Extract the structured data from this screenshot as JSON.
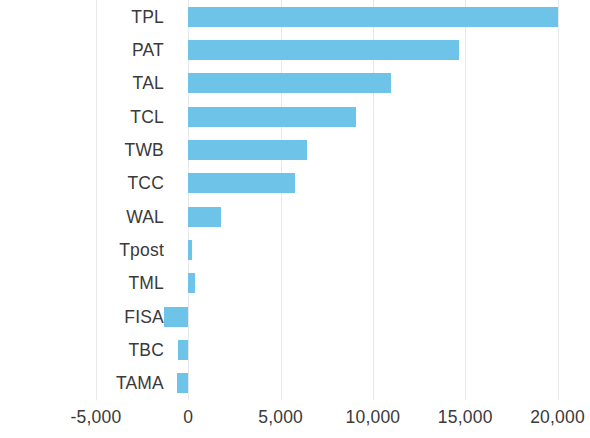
{
  "chart": {
    "type": "bar",
    "orientation": "horizontal",
    "title": "",
    "xlabel": "",
    "ylabel": "",
    "bar_color": "#6ec3e9",
    "gridline_color": "#e6e9ec",
    "text_color": "#3a3a3a",
    "background_color": "#ffffff"
  },
  "chart_data": {
    "type": "bar",
    "orientation": "horizontal",
    "title": "",
    "subtitle": "",
    "xlabel": "",
    "ylabel": "",
    "categories": [
      "TPL",
      "PAT",
      "TAL",
      "TCL",
      "TWB",
      "TCC",
      "WAL",
      "Tpost",
      "TML",
      "FISA",
      "TBC",
      "TAMA"
    ],
    "values": [
      20000,
      14650,
      11000,
      9070,
      6450,
      5790,
      1750,
      200,
      350,
      -1310,
      -550,
      -600
    ],
    "series": [
      {
        "name": "",
        "values": [
          20000,
          14650,
          11000,
          9070,
          6450,
          5790,
          1750,
          200,
          350,
          -1310,
          -550,
          -600
        ]
      }
    ],
    "xlim": [
      -5000,
      21000
    ],
    "xticks": [
      -5000,
      0,
      5000,
      10000,
      15000,
      20000
    ],
    "xticklabels": [
      "-5,000",
      "0",
      "5,000",
      "10,000",
      "15,000",
      "20,000"
    ],
    "grid": true,
    "grid_axis": "x",
    "legend": false,
    "legend_position": "none",
    "annotations": []
  }
}
